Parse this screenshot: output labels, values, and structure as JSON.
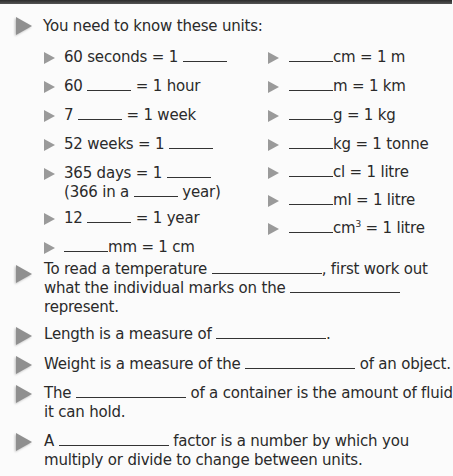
{
  "intro": "You need to know these units:",
  "left_units": [
    {
      "before": "60 seconds = 1 ",
      "after": ""
    },
    {
      "before": "60 ",
      "after": " = 1 hour"
    },
    {
      "before": "7 ",
      "after": " = 1 week"
    },
    {
      "before": "52 weeks = 1 ",
      "after": ""
    },
    {
      "before": "365 days = 1 ",
      "after": "",
      "line2_before": "(366 in a ",
      "line2_after": " year)"
    },
    {
      "before": "12 ",
      "after": " = 1 year"
    },
    {
      "before": "",
      "after": "mm = 1 cm"
    }
  ],
  "right_units": [
    {
      "after": "cm = 1 m"
    },
    {
      "after": "m = 1 km"
    },
    {
      "after": "g = 1 kg"
    },
    {
      "after": "kg = 1 tonne"
    },
    {
      "after": "cl = 1 litre"
    },
    {
      "after": "ml = 1 litre"
    },
    {
      "after": "cm",
      "sup": "3",
      "after2": " = 1 litre"
    }
  ],
  "statements": [
    {
      "l1a": "To read a temperature ",
      "l1b": ", first work out",
      "l2a": "what the individual marks on the ",
      "l3": "represent."
    },
    {
      "l1a": "Length is a measure of ",
      "l1b": "."
    },
    {
      "l1a": "Weight is a measure of the ",
      "l1b": " of an object."
    },
    {
      "l1a": "The ",
      "l1b": " of a container is the amount of fluid",
      "l2": "it can hold."
    },
    {
      "l1a": "A ",
      "l1b": " factor is a number by which you",
      "l2": "multiply or divide to change between units."
    }
  ]
}
